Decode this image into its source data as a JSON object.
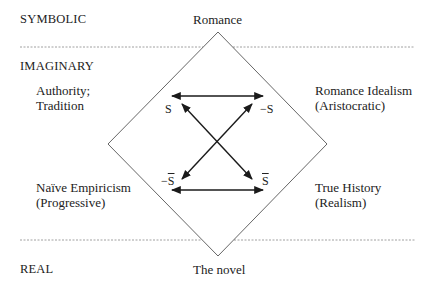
{
  "registers": {
    "symbolic": "SYMBOLIC",
    "imaginary": "IMAGINARY",
    "real": "REAL"
  },
  "vertices": {
    "top": "Romance",
    "bottom": "The novel"
  },
  "positions": {
    "top_left_line1": "Authority;",
    "top_left_line2": "Tradition",
    "top_right_line1": "Romance Idealism",
    "top_right_line2": "(Aristocratic)",
    "bottom_left_line1": "Naïve Empiricism",
    "bottom_left_line2": "(Progressive)",
    "bottom_right_line1": "True History",
    "bottom_right_line2": "(Realism)"
  },
  "square": {
    "s": "S",
    "neg_s": "−S",
    "neg_s_bar_prefix": "−",
    "neg_s_bar_letter": "S",
    "s_bar_letter": "S"
  },
  "colors": {
    "line": "#555555",
    "arrow": "#1a1a1a",
    "dotted": "#888888"
  }
}
